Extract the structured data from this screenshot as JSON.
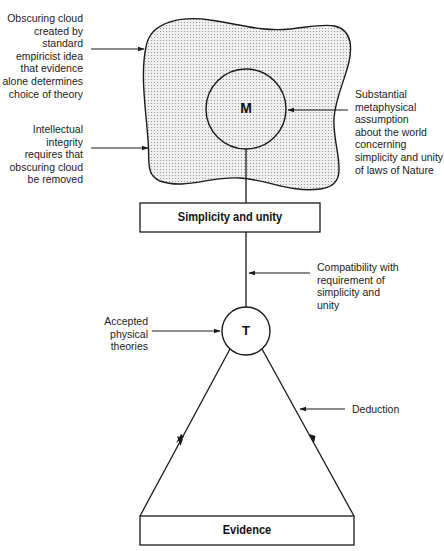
{
  "diagram": {
    "nodes": {
      "metaphysics_circle": {
        "label": "M"
      },
      "theory_circle": {
        "label": "T"
      },
      "simplicity_box": {
        "label": "Simplicity and unity"
      },
      "evidence_box": {
        "label": "Evidence"
      }
    },
    "annotations": {
      "obscuring_cloud": "Obscuring cloud\ncreated by\nstandard\nempiricist idea\nthat evidence\nalone determines\nchoice of theory",
      "intellectual_integrity": "Intellectual\nintegrity\nrequires that\nobscuring cloud\nbe removed",
      "metaphysical_assumption": "Substantial\nmetaphysical\nassumption\nabout the world\nconcerning\nsimplicity and unity\nof laws of Nature",
      "compatibility": "Compatibility with\nrequirement of\nsimplicity and\nunity",
      "accepted_theories": "Accepted\nphysical\ntheories",
      "deduction": "Deduction"
    },
    "colors": {
      "stroke": "#1a1a1a",
      "cloud_fill": "#e6e6e6",
      "cloud_dots": "#8c8c8c"
    }
  }
}
